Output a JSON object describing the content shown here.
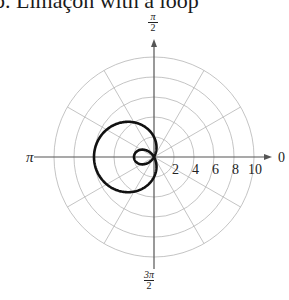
{
  "title": "b. Limaçon with a loop",
  "chart_data": {
    "type": "polar",
    "title": "Limaçon with a loop",
    "equation": "r = 2 - 4cos(θ)",
    "angle_labels": {
      "right": "0",
      "top_num": "π",
      "top_den": "2",
      "left": "π",
      "bottom_num": "3π",
      "bottom_den": "2"
    },
    "radial_ticks": [
      "2",
      "4",
      "6",
      "8",
      "10"
    ],
    "radial_values": [
      2,
      4,
      6,
      8,
      10
    ],
    "rmax": 10,
    "grid": true,
    "spokes_deg": [
      0,
      30,
      60,
      90,
      120,
      150,
      180,
      210,
      240,
      270,
      300,
      330
    ],
    "series": [
      {
        "name": "limacon",
        "formula": "r = 2 - 4cos(θ)",
        "theta_range": [
          0,
          6.2832
        ],
        "sample_points": [
          {
            "theta": 0,
            "r": -2
          },
          {
            "theta": 1.0472,
            "r": 0
          },
          {
            "theta": 1.5708,
            "r": 2
          },
          {
            "theta": 3.1416,
            "r": 6
          },
          {
            "theta": 4.7124,
            "r": 2
          },
          {
            "theta": 5.236,
            "r": 0
          }
        ]
      }
    ]
  }
}
